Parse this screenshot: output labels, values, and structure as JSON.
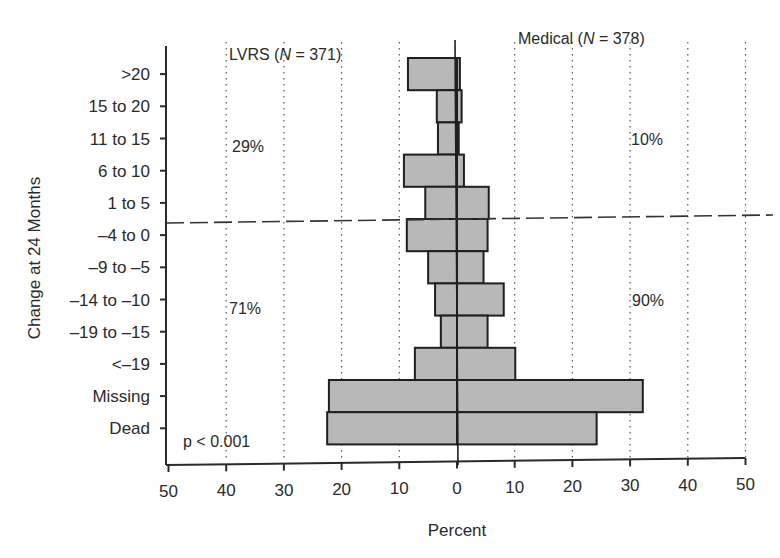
{
  "chart_data": {
    "type": "bar",
    "orientation": "horizontal-back-to-back",
    "title": "",
    "xlabel": "Percent",
    "ylabel": "Change at 24 Months",
    "xlim": [
      -50,
      50
    ],
    "x_ticks": [
      50,
      40,
      30,
      20,
      10,
      0,
      10,
      20,
      30,
      40,
      50
    ],
    "grid": "vertical dotted lines at every 10%",
    "categories": [
      ">20",
      "15 to 20",
      "11 to 15",
      "6 to 10",
      "1 to 5",
      "–4 to 0",
      "–9 to –5",
      "–14 to –10",
      "–19 to –15",
      "<–19",
      "Missing",
      "Dead"
    ],
    "series": [
      {
        "name": "LVRS (N = 371)",
        "side": "left",
        "values": [
          8.5,
          3.5,
          3.3,
          9.2,
          5.5,
          8.7,
          5.0,
          3.8,
          2.8,
          7.3,
          22.2,
          22.5
        ]
      },
      {
        "name": "Medical (N = 378)",
        "side": "right",
        "values": [
          0.5,
          0.8,
          0.3,
          1.2,
          5.5,
          5.3,
          4.6,
          8.1,
          5.3,
          10.1,
          32.2,
          24.2
        ]
      }
    ],
    "annotations": [
      {
        "text": "29%",
        "group": "LVRS",
        "region": "above dashed line"
      },
      {
        "text": "71%",
        "group": "LVRS",
        "region": "below dashed line"
      },
      {
        "text": "10%",
        "group": "Medical",
        "region": "above dashed line"
      },
      {
        "text": "90%",
        "group": "Medical",
        "region": "below dashed line"
      },
      {
        "text": "p < 0.001",
        "region": "bottom-left"
      }
    ],
    "divider": "dashed horizontal line between '1 to 5' and '–4 to 0'"
  },
  "labels": {
    "lvrs_header": "LVRS (",
    "lvrs_n": "N",
    "lvrs_count": " = 371)",
    "medical_header": "Medical (",
    "medical_n": "N",
    "medical_count": " = 378)",
    "lvrs_above": "29%",
    "lvrs_below": "71%",
    "medical_above": "10%",
    "medical_below": "90%",
    "pvalue": "p < 0.001",
    "xlabel": "Percent",
    "ylabel": "Change at 24 Months"
  }
}
